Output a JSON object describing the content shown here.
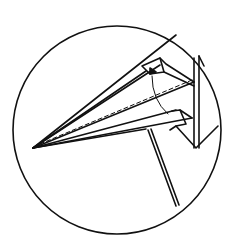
{
  "diagram": {
    "title": "",
    "elements": [
      {
        "id": "callout-circle",
        "type": "circle"
      },
      {
        "id": "airplane-nose",
        "type": "folded-paper"
      },
      {
        "id": "center-crease",
        "type": "dashed-line"
      },
      {
        "id": "fold-arrow",
        "type": "curved-arrow"
      },
      {
        "id": "support-stick",
        "type": "line"
      }
    ],
    "colors": {
      "stroke": "#111111",
      "background": "#ffffff"
    }
  }
}
